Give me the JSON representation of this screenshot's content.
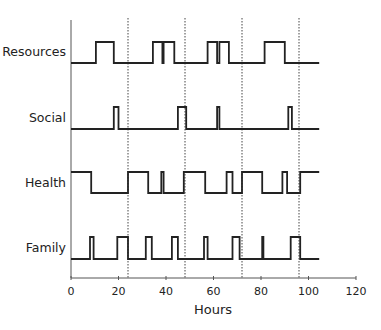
{
  "chart_data": {
    "type": "line",
    "subtype": "step",
    "title": "",
    "xlabel": "Hours",
    "ylabel": "",
    "xlim": [
      0,
      120
    ],
    "x_ticks": [
      0,
      20,
      40,
      60,
      80,
      100,
      120
    ],
    "grid": false,
    "reference_lines": {
      "style": "dotted",
      "x": [
        24,
        48,
        72,
        96
      ]
    },
    "legend": null,
    "series": [
      {
        "name": "Resources",
        "x_range": [
          0,
          104.5
        ],
        "high_intervals": [
          [
            10.5,
            18
          ],
          [
            34.5,
            38.5
          ],
          [
            39,
            43.5
          ],
          [
            57.5,
            61.5
          ],
          [
            62.5,
            66.5
          ],
          [
            81.5,
            90
          ]
        ]
      },
      {
        "name": "Social",
        "x_range": [
          0,
          104.5
        ],
        "high_intervals": [
          [
            18,
            20
          ],
          [
            45,
            48.5
          ],
          [
            61.5,
            62.5
          ],
          [
            91.5,
            93
          ]
        ]
      },
      {
        "name": "Health",
        "x_range": [
          0,
          104.5
        ],
        "high_intervals": [
          [
            0,
            8.5
          ],
          [
            24,
            32.5
          ],
          [
            38,
            39
          ],
          [
            47.5,
            56.5
          ],
          [
            65.5,
            68
          ],
          [
            72,
            80.5
          ],
          [
            89,
            91
          ],
          [
            96.5,
            104.5
          ]
        ]
      },
      {
        "name": "Family",
        "x_range": [
          0,
          104.5
        ],
        "high_intervals": [
          [
            8,
            9.5
          ],
          [
            19.5,
            24
          ],
          [
            31.5,
            34
          ],
          [
            42.5,
            45
          ],
          [
            56,
            57.5
          ],
          [
            68,
            71
          ],
          [
            80.5,
            81
          ],
          [
            92.5,
            96.5
          ]
        ]
      }
    ]
  },
  "labels": {
    "rows": [
      "Resources",
      "Social",
      "Health",
      "Family"
    ],
    "x_axis_title": "Hours",
    "x_ticks": [
      "0",
      "20",
      "40",
      "60",
      "80",
      "100",
      "120"
    ]
  },
  "colors": {
    "line": "#222222",
    "axis": "#555555",
    "reference": "#444444"
  }
}
